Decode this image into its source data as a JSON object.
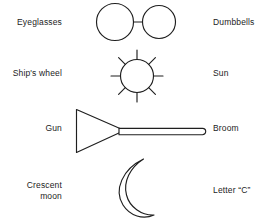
{
  "page": {
    "background_color": "#ffffff",
    "ink_color": "#1f1f1f"
  },
  "rows": [
    {
      "id": "eyeglasses",
      "left_label": "Eyeglasses",
      "right_label": "Dumbbells",
      "figure_name": "two-circles-joined-by-bar"
    },
    {
      "id": "sun",
      "left_label": "Ship's wheel",
      "right_label": "Sun",
      "figure_name": "circle-with-eight-radiating-spokes"
    },
    {
      "id": "gun",
      "left_label": "Gun",
      "right_label": "Broom",
      "figure_name": "triangle-with-long-rod"
    },
    {
      "id": "moon",
      "left_label": "Crescent\nmoon",
      "right_label": "Letter “C”",
      "figure_name": "crescent-outline"
    }
  ]
}
